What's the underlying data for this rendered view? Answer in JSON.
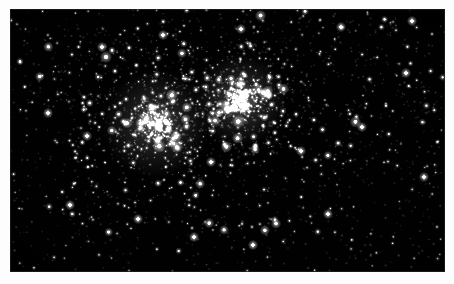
{
  "figure": {
    "kind": "astronomical-photograph",
    "caption": "",
    "alt_text": "Dense field of stars containing two adjacent open star clusters"
  },
  "plate": {
    "background_color": "#010101",
    "page_color": "#ffffff",
    "star_color": "#ffffff",
    "x": 10,
    "y": 9,
    "width": 435,
    "height": 263
  },
  "scene": {
    "type": "star-field",
    "total_stars": 2600,
    "clusters": [
      {
        "name": "left-cluster",
        "center_x": 0.335,
        "center_y": 0.435,
        "core_radius": 0.052,
        "halo_radius": 0.155,
        "star_count": 470,
        "core_brightness": 0.92
      },
      {
        "name": "right-cluster",
        "center_x": 0.53,
        "center_y": 0.345,
        "core_radius": 0.044,
        "halo_radius": 0.138,
        "star_count": 520,
        "core_brightness": 1.0
      }
    ],
    "field_stars": 1610,
    "density_gradient": {
      "bright_corner": "top-left-to-center",
      "sparse_corner": "bottom-left"
    }
  }
}
